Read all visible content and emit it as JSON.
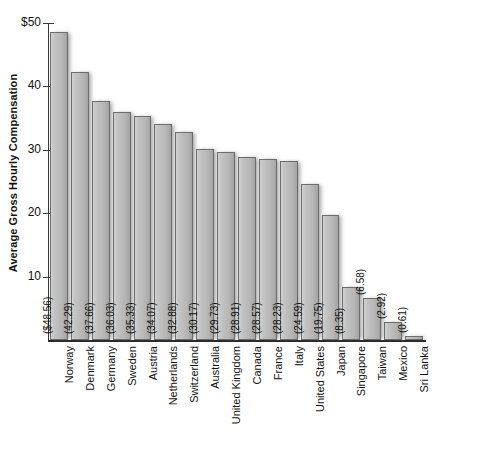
{
  "chart_data": {
    "type": "bar",
    "title": "",
    "xlabel": "",
    "ylabel": "Average Gross Hourly Compensation",
    "ylim": [
      0,
      50
    ],
    "yticks": [
      10,
      20,
      30,
      40,
      50
    ],
    "ytick_labels": [
      "10",
      "20",
      "30",
      "40",
      "$50"
    ],
    "grid": false,
    "legend": null,
    "orientation": "vertical",
    "categories": [
      "Norway",
      "Denmark",
      "Germany",
      "Sweden",
      "Austria",
      "Netherlands",
      "Switzerland",
      "Australia",
      "United Kingdom",
      "Canada",
      "France",
      "Italy",
      "United States",
      "Japan",
      "Singapore",
      "Taiwan",
      "Mexico",
      "Sri Lanka"
    ],
    "values": [
      48.56,
      42.29,
      37.66,
      36.03,
      35.33,
      34.07,
      32.88,
      30.17,
      29.73,
      28.91,
      28.57,
      28.23,
      24.59,
      19.75,
      8.35,
      6.58,
      2.92,
      0.61
    ],
    "data_labels": [
      "($48.56)",
      "(42.29)",
      "(37.66)",
      "(36.03)",
      "(35.33)",
      "(34.07)",
      "(32.88)",
      "(30.17)",
      "(29.73)",
      "(28.91)",
      "(28.57)",
      "(28.23)",
      "(24.59)",
      "(19.75)",
      "(8.35)",
      "(6.58)",
      "(2.92)",
      "(0.61)"
    ]
  },
  "colors": {
    "background": "#ffffff",
    "bar_fill": "#bdbdbd",
    "bar_border": "#6d6d6d",
    "axis": "#2a2a2a",
    "text": "#111111"
  }
}
